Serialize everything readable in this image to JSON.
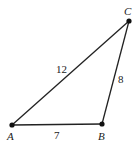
{
  "diagram": {
    "type": "triangle",
    "vertices": [
      {
        "label": "A",
        "x": 12,
        "y": 125
      },
      {
        "label": "B",
        "x": 102,
        "y": 124
      },
      {
        "label": "C",
        "x": 129,
        "y": 21
      }
    ],
    "sides": [
      {
        "from": "A",
        "to": "B",
        "length_label": "7"
      },
      {
        "from": "B",
        "to": "C",
        "length_label": "8"
      },
      {
        "from": "A",
        "to": "C",
        "length_label": "12"
      }
    ],
    "colors": {
      "line": "#222222",
      "point": "#111111",
      "background": "#ffffff"
    }
  }
}
